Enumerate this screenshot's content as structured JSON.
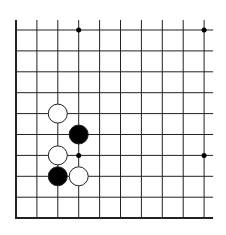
{
  "board": {
    "type": "go-diagram-fragment",
    "columns": 10,
    "rows": 10,
    "origin_x": 16,
    "origin_y": 30,
    "spacing": 20.9,
    "edges": {
      "left": true,
      "bottom": true,
      "top": false,
      "right": false
    },
    "line_color": "#222222",
    "background": "#ffffff"
  },
  "star_points": [
    {
      "col": 3,
      "row": 0
    },
    {
      "col": 9,
      "row": 0
    },
    {
      "col": 9,
      "row": 6
    },
    {
      "col": 3,
      "row": 6
    }
  ],
  "stones": [
    {
      "color": "white",
      "col": 2,
      "row": 4
    },
    {
      "color": "black",
      "col": 3,
      "row": 5
    },
    {
      "color": "white",
      "col": 2,
      "row": 6
    },
    {
      "color": "black",
      "col": 2,
      "row": 7
    },
    {
      "color": "white",
      "col": 3,
      "row": 7
    }
  ],
  "colors": {
    "black_stone": "#000000",
    "white_stone": "#ffffff",
    "stone_outline": "#222222"
  }
}
